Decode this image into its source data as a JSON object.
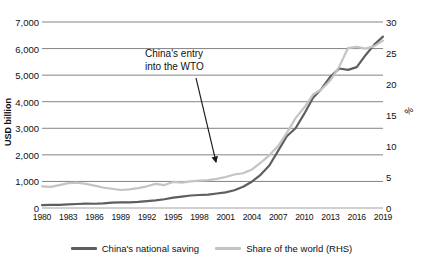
{
  "chart_data": {
    "type": "line",
    "title": "",
    "subtitle": "",
    "xlabel": "",
    "ylabel": "USD billion",
    "y2label": "%",
    "ylim": [
      0,
      7000
    ],
    "y2lim": [
      0,
      30
    ],
    "grid": true,
    "legend_position": "bottom",
    "x_tick_labels": [
      "1980",
      "1983",
      "1986",
      "1989",
      "1992",
      "1995",
      "1998",
      "2001",
      "2004",
      "2007",
      "2010",
      "2013",
      "2016",
      "2019"
    ],
    "y_tick_labels": [
      "0",
      "1,000",
      "2,000",
      "3,000",
      "4,000",
      "5,000",
      "6,000",
      "7,000"
    ],
    "y2_tick_labels": [
      "0",
      "5",
      "10",
      "15",
      "20",
      "25",
      "30"
    ],
    "y_ticks": [
      0,
      1000,
      2000,
      3000,
      4000,
      5000,
      6000,
      7000
    ],
    "y2_ticks": [
      0,
      5,
      10,
      15,
      20,
      25,
      30
    ],
    "x": [
      1980,
      1981,
      1982,
      1983,
      1984,
      1985,
      1986,
      1987,
      1988,
      1989,
      1990,
      1991,
      1992,
      1993,
      1994,
      1995,
      1996,
      1997,
      1998,
      1999,
      2000,
      2001,
      2002,
      2003,
      2004,
      2005,
      2006,
      2007,
      2008,
      2009,
      2010,
      2011,
      2012,
      2013,
      2014,
      2015,
      2016,
      2017,
      2018,
      2019
    ],
    "series": [
      {
        "name": "China's national saving",
        "axis": "left",
        "unit": "USD billion",
        "color": "#5e5e5e",
        "values": [
          110,
          115,
          120,
          135,
          150,
          165,
          160,
          175,
          200,
          210,
          215,
          230,
          260,
          290,
          330,
          390,
          430,
          470,
          490,
          505,
          545,
          590,
          670,
          800,
          990,
          1250,
          1600,
          2150,
          2700,
          3000,
          3550,
          4150,
          4500,
          4950,
          5250,
          5200,
          5300,
          5750,
          6150,
          6450
        ]
      },
      {
        "name": "Share of the world (RHS)",
        "axis": "right",
        "unit": "%",
        "color": "#c4c4c4",
        "values": [
          3.5,
          3.4,
          3.7,
          4.0,
          4.1,
          3.9,
          3.6,
          3.3,
          3.1,
          2.9,
          3.0,
          3.2,
          3.5,
          3.9,
          3.7,
          4.2,
          4.1,
          4.3,
          4.4,
          4.5,
          4.7,
          5.0,
          5.4,
          5.6,
          6.2,
          7.3,
          8.5,
          10.0,
          12.1,
          14.5,
          16.2,
          18.3,
          19.2,
          20.6,
          22.8,
          25.8,
          26.0,
          25.7,
          26.1,
          27.0
        ]
      }
    ],
    "annotations": [
      {
        "text_line1": "China's entry",
        "text_line2": "into the WTO",
        "points_to_year": 2001,
        "points_to_value": 5.5
      }
    ]
  },
  "axes": {
    "left_title": "USD billion",
    "right_title": "%"
  },
  "legend": {
    "items": [
      {
        "label": "China's national saving",
        "color": "#5e5e5e"
      },
      {
        "label": "Share of the world (RHS)",
        "color": "#c4c4c4"
      }
    ]
  },
  "annotation": {
    "line1": "China's entry",
    "line2": "into the WTO"
  }
}
